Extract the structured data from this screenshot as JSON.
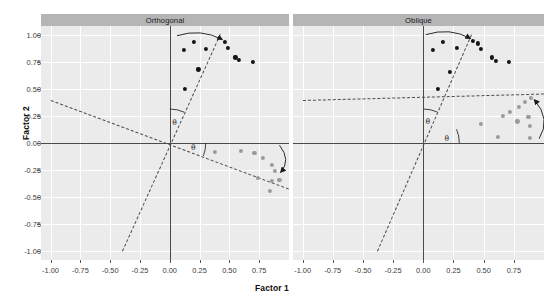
{
  "chart_data": {
    "type": "scatter",
    "title": "",
    "xlabel": "Factor 1",
    "ylabel": "Factor 2",
    "xlim": [
      -1.08,
      1.0
    ],
    "ylim": [
      -1.08,
      1.08
    ],
    "grid": true,
    "legend": "none",
    "facet_variable": "rotation",
    "facets": [
      "Orthogonal",
      "Oblique"
    ],
    "xticks": [
      "-1.00",
      "-0.75",
      "-0.50",
      "-0.25",
      "0.00",
      "0.25",
      "0.50",
      "0.75"
    ],
    "xtick_values": [
      -1.0,
      -0.75,
      -0.5,
      -0.25,
      0.0,
      0.25,
      0.5,
      0.75
    ],
    "yticks": [
      "1.00",
      "0.75",
      "0.50",
      "0.25",
      "0.00",
      "-0.25",
      "-0.50",
      "-0.75",
      "-1.00"
    ],
    "ytick_values": [
      1.0,
      0.75,
      0.5,
      0.25,
      0.0,
      -0.25,
      -0.5,
      -0.75,
      -1.0
    ],
    "annotations": [
      "θ",
      "θ",
      "θ",
      "θ"
    ],
    "panels": [
      {
        "name": "Orthogonal",
        "series": [
          {
            "name": "factor-1-loadings",
            "color": "#141414",
            "points": [
              [
                0.2,
                0.93
              ],
              [
                0.12,
                0.86
              ],
              [
                0.3,
                0.87
              ],
              [
                0.46,
                0.93
              ],
              [
                0.49,
                0.88
              ],
              [
                0.55,
                0.79
              ],
              [
                0.58,
                0.77
              ],
              [
                0.7,
                0.75
              ],
              [
                0.24,
                0.68
              ],
              [
                0.13,
                0.5
              ]
            ]
          },
          {
            "name": "factor-2-loadings",
            "color": "#9a9a9a",
            "points": [
              [
                0.38,
                -0.08
              ],
              [
                0.6,
                -0.07
              ],
              [
                0.71,
                -0.09
              ],
              [
                0.78,
                -0.14
              ],
              [
                0.86,
                -0.2
              ],
              [
                0.88,
                -0.26
              ],
              [
                0.74,
                -0.32
              ],
              [
                0.86,
                -0.35
              ],
              [
                0.84,
                -0.44
              ],
              [
                0.92,
                -0.34
              ]
            ]
          }
        ],
        "lines": [
          {
            "name": "rotated-axis-1",
            "from": [
              -0.4,
              -1.0
            ],
            "to": [
              0.42,
              1.0
            ],
            "style": "dashed"
          },
          {
            "name": "rotated-axis-2",
            "from": [
              -1.0,
              0.4
            ],
            "to": [
              1.0,
              -0.42
            ],
            "style": "dashed"
          }
        ]
      },
      {
        "name": "Oblique",
        "series": [
          {
            "name": "factor-1-loadings",
            "color": "#141414",
            "points": [
              [
                0.16,
                0.93
              ],
              [
                0.08,
                0.86
              ],
              [
                0.28,
                0.88
              ],
              [
                0.41,
                0.94
              ],
              [
                0.45,
                0.92
              ],
              [
                0.48,
                0.87
              ],
              [
                0.57,
                0.79
              ],
              [
                0.6,
                0.76
              ],
              [
                0.71,
                0.75
              ],
              [
                0.22,
                0.66
              ],
              [
                0.12,
                0.5
              ]
            ]
          },
          {
            "name": "factor-2-loadings",
            "color": "#9a9a9a",
            "points": [
              [
                0.48,
                0.18
              ],
              [
                0.66,
                0.25
              ],
              [
                0.72,
                0.29
              ],
              [
                0.79,
                0.33
              ],
              [
                0.84,
                0.38
              ],
              [
                0.89,
                0.42
              ],
              [
                0.78,
                0.2
              ],
              [
                0.87,
                0.24
              ],
              [
                0.88,
                0.16
              ],
              [
                0.62,
                0.06
              ],
              [
                0.88,
                0.05
              ]
            ]
          }
        ],
        "lines": [
          {
            "name": "rotated-axis-1",
            "from": [
              -0.38,
              -1.0
            ],
            "to": [
              0.4,
              1.0
            ],
            "style": "dashed"
          },
          {
            "name": "rotated-axis-2",
            "from": [
              -1.0,
              0.4
            ],
            "to": [
              1.0,
              0.46
            ],
            "style": "dashed"
          }
        ]
      }
    ]
  },
  "panel_strips": {
    "left": "Orthogonal",
    "right": "Oblique"
  },
  "axis_titles": {
    "x": "Factor 1",
    "y": "Factor 2"
  },
  "colors": {
    "panel_background": "#ebebeb",
    "grid": "#ffffff",
    "strip_background": "#b5b5b5",
    "axis_line": "#4a4a4a",
    "point_primary": "#141414",
    "point_secondary": "#9a9a9a",
    "dashed_line": "#4d4d4d",
    "tick_label": "#3b3b3b"
  }
}
